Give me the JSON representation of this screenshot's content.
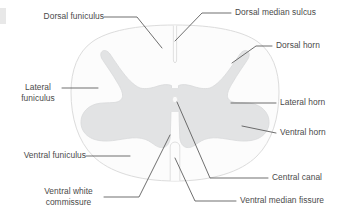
{
  "figure": {
    "colors": {
      "background": "#ffffff",
      "gray_matter_fill": "#e2e3e4",
      "gray_matter_stroke": "#d6d7d8",
      "white_matter_fill": "#fcfcfc",
      "outline_stroke": "#dcdcdc",
      "leader_line": "#555555",
      "label_text": "#4a4a4a"
    }
  },
  "labels": {
    "dorsal_funiculus": "Dorsal funiculus",
    "dorsal_median_sulcus": "Dorsal median sulcus",
    "dorsal_horn": "Dorsal horn",
    "lateral_funiculus_line1": "Lateral",
    "lateral_funiculus_line2": "funiculus",
    "lateral_horn": "Lateral horn",
    "ventral_horn": "Ventral horn",
    "ventral_funiculus": "Ventral funiculus",
    "central_canal": "Central canal",
    "ventral_white_commissure_line1": "Ventral white",
    "ventral_white_commissure_line2": "commissure",
    "ventral_median_fissure": "Ventral median fissure"
  }
}
